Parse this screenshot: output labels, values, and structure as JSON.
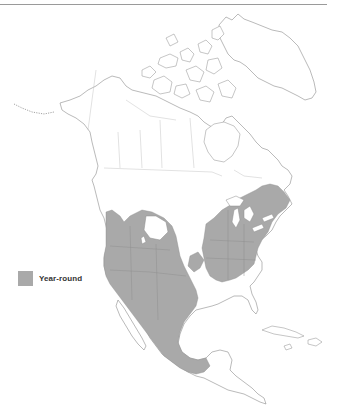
{
  "map": {
    "region": "North America",
    "legend": [
      {
        "label": "Year-round",
        "color": "#a9a9a9"
      }
    ],
    "colors": {
      "range_fill": "#a9a9a9",
      "land_fill": "#ffffff",
      "coastline": "#8c8c8c",
      "political_border": "#c4c4c4"
    }
  }
}
